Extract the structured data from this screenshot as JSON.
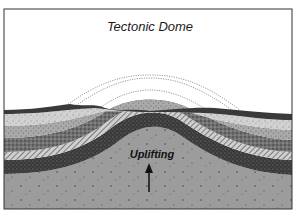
{
  "diagram": {
    "title": "Tectonic Dome",
    "process_label": "Uplifting",
    "arrow_direction": "up",
    "layers_top_to_bottom": [
      {
        "name": "eroded-surface-thin-dark",
        "color": "#3a3a3a"
      },
      {
        "name": "light-stippled-sandstone",
        "color": "#cfcfcf"
      },
      {
        "name": "medium-stippled-layer",
        "color": "#a9a9a9"
      },
      {
        "name": "dark-speckled-layer",
        "color": "#6e6e6e"
      },
      {
        "name": "hatched-layer",
        "color": "#bdbdbd"
      },
      {
        "name": "dark-crosshatched-layer",
        "color": "#3c3c3c"
      },
      {
        "name": "basement-uplifted-core",
        "color": "#9c9c9c"
      }
    ],
    "eroded_layers_dotted_arcs": 4,
    "colors": {
      "background": "#ffffff",
      "frame": "#333333",
      "basement": "#9c9c9c"
    }
  }
}
